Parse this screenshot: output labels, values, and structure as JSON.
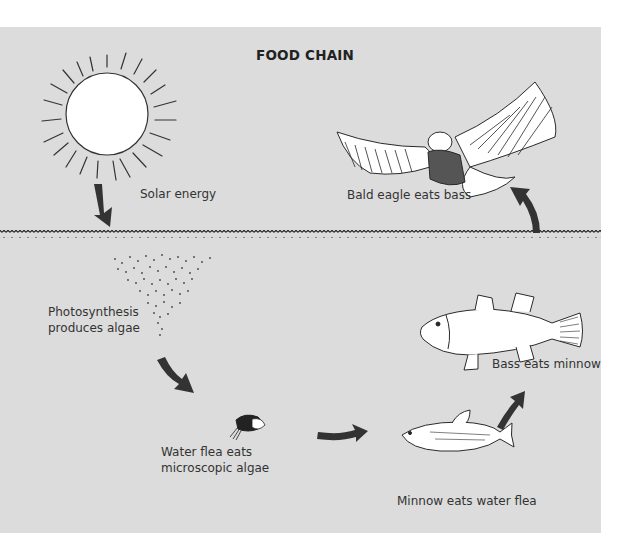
{
  "title": "FOOD CHAIN",
  "labels": {
    "solar": "Solar energy",
    "eagle": "Bald eagle eats bass",
    "algae_line1": "Photosynthesis",
    "algae_line2": "produces algae",
    "flea_line1": "Water flea eats",
    "flea_line2": "microscopic algae",
    "minnow": "Minnow eats water flea",
    "bass": "Bass eats minnow"
  },
  "stages": [
    {
      "order": 1,
      "name": "Sun",
      "caption": "Solar energy",
      "zone": "above water"
    },
    {
      "order": 2,
      "name": "Algae",
      "caption": "Photosynthesis produces algae",
      "zone": "water"
    },
    {
      "order": 3,
      "name": "Water flea",
      "caption": "Water flea eats microscopic algae",
      "zone": "water"
    },
    {
      "order": 4,
      "name": "Minnow",
      "caption": "Minnow eats water flea",
      "zone": "water"
    },
    {
      "order": 5,
      "name": "Bass",
      "caption": "Bass eats minnow",
      "zone": "water"
    },
    {
      "order": 6,
      "name": "Bald eagle",
      "caption": "Bald eagle eats bass",
      "zone": "above water"
    }
  ],
  "colors": {
    "background": "#dcdcdc",
    "arrow": "#333333",
    "outline": "#2a2a2a"
  }
}
